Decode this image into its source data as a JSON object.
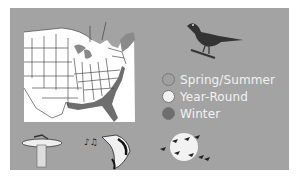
{
  "legend": {
    "items": [
      {
        "label": "Spring/Summer",
        "color": "#a0a0a0"
      },
      {
        "label": "Year-Round",
        "color": "#f2f2f2"
      },
      {
        "label": "Winter",
        "color": "#6e6e6e"
      }
    ]
  },
  "icons": {
    "bird": "bird-silhouette-icon",
    "feeder": "bird-bath-icon",
    "song": "singing-bird-icon",
    "migration": "migrating-flock-icon"
  },
  "colors": {
    "background": "#a3a3a3",
    "map_land": "#ffffff",
    "winter_region": "#6e6e6e",
    "bird": "#333333"
  }
}
